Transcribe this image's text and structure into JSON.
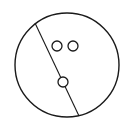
{
  "diagram": {
    "stroke_color": "#1a1a1a",
    "background": "#ffffff",
    "outer_circle": {
      "cx": 67,
      "cy": 65,
      "r": 52
    },
    "divider_line": {
      "x1": 35,
      "y1": 23,
      "x2": 79,
      "y2": 116
    },
    "small_circles": [
      {
        "cx": 57,
        "cy": 46,
        "r": 5
      },
      {
        "cx": 73,
        "cy": 46,
        "r": 5
      },
      {
        "cx": 63,
        "cy": 82,
        "r": 5
      }
    ]
  }
}
